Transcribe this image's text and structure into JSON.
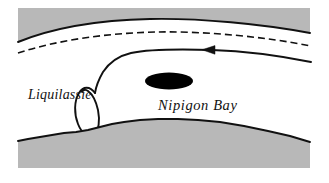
{
  "figure": {
    "kind": "map-diagram",
    "width": 329,
    "height": 183,
    "background_color": "#ffffff"
  },
  "colors": {
    "land_shading": "#b8b8b8",
    "water": "#ffffff",
    "ink": "#111111",
    "feature_fill": "#000000",
    "page_background": "#ffffff"
  },
  "labels": {
    "liquilassie": "Liquilassie",
    "nipigon_bay": "Nipigon Bay"
  },
  "features": {
    "shore_top": {
      "name": "northern-shoreline",
      "style": "solid",
      "stroke_width": 1.8
    },
    "shore_bottom": {
      "name": "southern-shoreline",
      "style": "solid-irregular",
      "stroke_width": 1.8
    },
    "dashed_boundary": {
      "name": "dashed-boundary-line",
      "style": "dashed",
      "dash_pattern": "7 4",
      "stroke_width": 1.6
    },
    "flow_arrow": {
      "name": "current-flow-arrow",
      "style": "solid",
      "stroke_width": 1.8,
      "arrow_direction": "left"
    },
    "loop": {
      "name": "liquilassie-loop",
      "style": "solid-open-loop",
      "stroke_width": 1.8
    },
    "island": {
      "name": "nipigon-bay-island",
      "style": "filled-ellipse",
      "fill": "#000000"
    }
  }
}
